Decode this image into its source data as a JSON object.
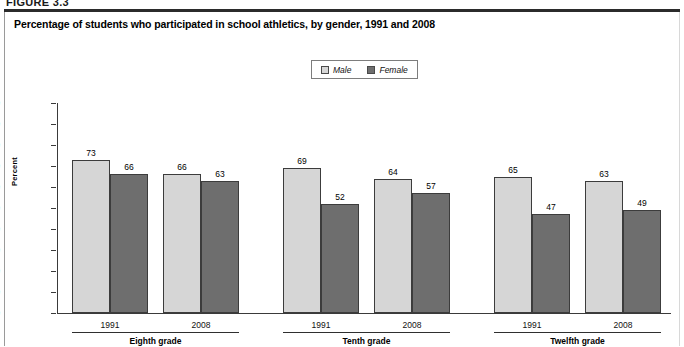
{
  "figure": {
    "tag": "FIGURE 3.3"
  },
  "chart_title": "Percentage of students who participated in school athletics, by gender, 1991 and 2008",
  "legend": {
    "items": [
      {
        "label": "Male",
        "color": "#d6d6d6",
        "icon": "legend-swatch-male"
      },
      {
        "label": "Female",
        "color": "#6e6e6e",
        "icon": "legend-swatch-female"
      }
    ]
  },
  "axis": {
    "y_title": "Percent",
    "y_ticks": [
      "100",
      "90",
      "80",
      "70",
      "60",
      "50",
      "40",
      "30",
      "20",
      "10",
      "0"
    ]
  },
  "groups": [
    {
      "label": "Eighth grade",
      "years": [
        "1991",
        "2008"
      ]
    },
    {
      "label": "Tenth grade",
      "years": [
        "1991",
        "2008"
      ]
    },
    {
      "label": "Twelfth grade",
      "years": [
        "1991",
        "2008"
      ]
    }
  ],
  "chart_data": {
    "type": "bar",
    "title": "Percentage of students who participated in school athletics, by gender, 1991 and 2008",
    "xlabel": "",
    "ylabel": "Percent",
    "ylim": [
      0,
      100
    ],
    "ytick_step": 10,
    "grid": false,
    "legend_position": "top-center",
    "categories": [
      "Eighth grade 1991",
      "Eighth grade 2008",
      "Tenth grade 1991",
      "Tenth grade 2008",
      "Twelfth grade 1991",
      "Twelfth grade 2008"
    ],
    "group_labels": [
      "Eighth grade",
      "Tenth grade",
      "Twelfth grade"
    ],
    "years": [
      "1991",
      "2008",
      "1991",
      "2008",
      "1991",
      "2008"
    ],
    "series": [
      {
        "name": "Male",
        "color": "#d6d6d6",
        "values": [
          73,
          66,
          69,
          64,
          65,
          63
        ]
      },
      {
        "name": "Female",
        "color": "#6e6e6e",
        "values": [
          66,
          63,
          52,
          57,
          47,
          49
        ]
      }
    ]
  }
}
